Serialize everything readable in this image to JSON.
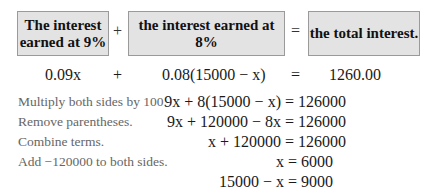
{
  "word_equation": {
    "box1": "The interest earned at 9%",
    "box1_line1": "The interest",
    "box1_line2": "earned at 9%",
    "plus": "+",
    "box2": "the interest earned at 8%",
    "equals": "=",
    "box3": "the total interest."
  },
  "algebraic_equation": {
    "term1": "0.09x",
    "plus": "+",
    "term2": "0.08(15000 − x)",
    "equals": "=",
    "result": "1260.00"
  },
  "steps": [
    {
      "note": "Multiply both sides by 100.",
      "equation": "9x + 8(15000 − x) = 126000"
    },
    {
      "note": "Remove parentheses.",
      "equation": "9x + 120000 − 8x = 126000"
    },
    {
      "note": "Combine terms.",
      "equation": "x + 120000 = 126000"
    },
    {
      "note": "Add −120000 to both sides.",
      "equation": "x = 6000"
    },
    {
      "note": "",
      "equation": "15000 − x = 9000"
    }
  ],
  "colors": {
    "box_fill": "#e3e3e3",
    "box_border": "#9a9a9a",
    "note_text": "#666666"
  }
}
